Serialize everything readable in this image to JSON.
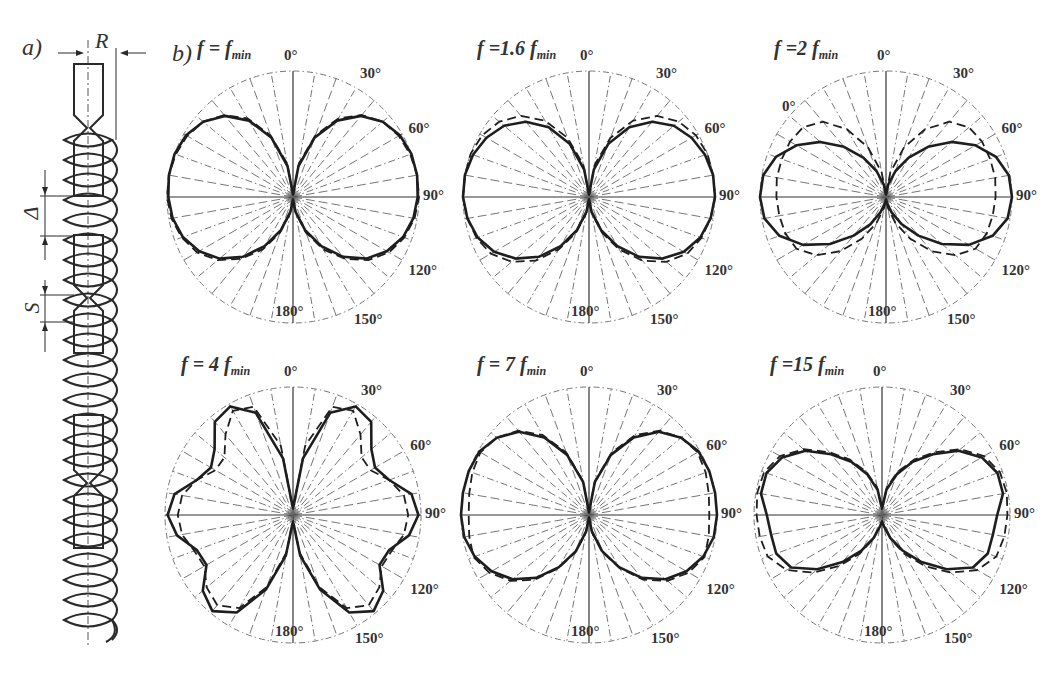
{
  "figure": {
    "panel_a_label": "a)",
    "panel_b_label": "b)",
    "helix_dimensions": {
      "radius": "R",
      "gap": "Δ",
      "pitch": "S"
    }
  },
  "chart_data": [
    {
      "type": "polar",
      "title": "f = f_min",
      "title_main": "f = f",
      "title_sub": "min",
      "center": [
        293,
        197
      ],
      "radius": 126,
      "angle_labels": [
        "0°",
        "30°",
        "60°",
        "90°",
        "120°",
        "150°",
        "180°"
      ],
      "series": [
        {
          "name": "measured",
          "style": "solid",
          "theta": [
            0,
            10,
            20,
            30,
            40,
            50,
            60,
            70,
            80,
            90,
            100,
            110,
            120,
            130,
            140,
            150,
            160,
            170,
            180
          ],
          "r": [
            0.02,
            0.25,
            0.5,
            0.7,
            0.84,
            0.93,
            0.98,
            1.0,
            1.0,
            0.99,
            0.97,
            0.93,
            0.86,
            0.76,
            0.62,
            0.45,
            0.28,
            0.12,
            0.02
          ]
        },
        {
          "name": "computed",
          "style": "dashed",
          "theta": [
            0,
            10,
            20,
            30,
            40,
            50,
            60,
            70,
            80,
            90,
            100,
            110,
            120,
            130,
            140,
            150,
            160,
            170,
            180
          ],
          "r": [
            0.02,
            0.27,
            0.52,
            0.72,
            0.85,
            0.93,
            0.97,
            0.99,
            1.0,
            1.0,
            0.98,
            0.94,
            0.88,
            0.78,
            0.64,
            0.48,
            0.3,
            0.13,
            0.02
          ]
        }
      ]
    },
    {
      "type": "polar",
      "title": "f = 1.6 f_min",
      "title_main": "f =1.6 f",
      "title_sub": "min",
      "center": [
        589,
        197
      ],
      "radius": 126,
      "angle_labels": [
        "0°",
        "30°",
        "60°",
        "90°",
        "120°",
        "150°",
        "180°"
      ],
      "series": [
        {
          "name": "measured",
          "style": "solid",
          "theta": [
            0,
            10,
            20,
            30,
            40,
            50,
            60,
            70,
            80,
            90,
            100,
            110,
            120,
            130,
            140,
            150,
            160,
            170,
            180
          ],
          "r": [
            0.02,
            0.22,
            0.45,
            0.64,
            0.78,
            0.88,
            0.94,
            0.98,
            1.0,
            1.0,
            0.98,
            0.94,
            0.87,
            0.76,
            0.62,
            0.45,
            0.28,
            0.12,
            0.02
          ]
        },
        {
          "name": "computed",
          "style": "dashed",
          "theta": [
            0,
            10,
            20,
            30,
            40,
            50,
            60,
            70,
            80,
            90,
            100,
            110,
            120,
            130,
            140,
            150,
            160,
            170,
            180
          ],
          "r": [
            0.02,
            0.26,
            0.5,
            0.7,
            0.84,
            0.93,
            0.98,
            1.0,
            1.0,
            1.0,
            0.98,
            0.95,
            0.9,
            0.8,
            0.66,
            0.48,
            0.3,
            0.13,
            0.02
          ]
        }
      ]
    },
    {
      "type": "polar",
      "title": "f = 2 f_min",
      "title_main": "f =2 f",
      "title_sub": "min",
      "center": [
        886,
        197
      ],
      "radius": 126,
      "angle_labels": [
        "0°",
        "30°",
        "60°",
        "90°",
        "120°",
        "150°",
        "180°"
      ],
      "extra_labels": [
        {
          "text": "0°",
          "x": 782,
          "y": 98
        }
      ],
      "series": [
        {
          "name": "measured",
          "style": "solid",
          "theta": [
            0,
            10,
            20,
            30,
            40,
            50,
            60,
            70,
            80,
            90,
            100,
            110,
            120,
            130,
            140,
            150,
            160,
            170,
            180
          ],
          "r": [
            0.02,
            0.1,
            0.22,
            0.36,
            0.52,
            0.68,
            0.82,
            0.93,
            0.99,
            1.0,
            0.98,
            0.9,
            0.76,
            0.58,
            0.4,
            0.25,
            0.13,
            0.05,
            0.02
          ]
        },
        {
          "name": "computed",
          "style": "dashed",
          "theta": [
            0,
            10,
            20,
            30,
            40,
            50,
            60,
            70,
            80,
            90,
            100,
            110,
            120,
            130,
            140,
            150,
            160,
            170,
            180
          ],
          "r": [
            0.02,
            0.2,
            0.42,
            0.62,
            0.78,
            0.86,
            0.88,
            0.88,
            0.88,
            0.87,
            0.86,
            0.85,
            0.82,
            0.72,
            0.56,
            0.38,
            0.22,
            0.09,
            0.02
          ]
        }
      ]
    },
    {
      "type": "polar",
      "title": "f = 4 f_min",
      "title_main": "f = 4 f",
      "title_sub": "min",
      "center": [
        293,
        515
      ],
      "radius": 128,
      "angle_labels": [
        "0°",
        "30°",
        "60°",
        "90°",
        "120°",
        "150°",
        "180°"
      ],
      "series": [
        {
          "name": "measured",
          "style": "solid",
          "theta": [
            0,
            10,
            20,
            30,
            40,
            50,
            60,
            70,
            80,
            90,
            100,
            110,
            120,
            130,
            140,
            150,
            160,
            170,
            180
          ],
          "r": [
            0.05,
            0.45,
            0.85,
            0.98,
            0.95,
            0.8,
            0.74,
            0.8,
            0.94,
            0.98,
            0.92,
            0.8,
            0.78,
            0.92,
            0.98,
            0.88,
            0.62,
            0.32,
            0.05
          ]
        },
        {
          "name": "computed",
          "style": "dashed",
          "theta": [
            0,
            10,
            20,
            30,
            40,
            50,
            60,
            70,
            80,
            90,
            100,
            110,
            120,
            130,
            140,
            150,
            160,
            170,
            180
          ],
          "r": [
            0.05,
            0.55,
            0.9,
            0.94,
            0.82,
            0.7,
            0.7,
            0.8,
            0.88,
            0.9,
            0.88,
            0.82,
            0.8,
            0.88,
            0.92,
            0.84,
            0.6,
            0.3,
            0.05
          ]
        }
      ]
    },
    {
      "type": "polar",
      "title": "f = 7 f_min",
      "title_main": "f = 7 f",
      "title_sub": "min",
      "center": [
        589,
        515
      ],
      "radius": 128,
      "angle_labels": [
        "0°",
        "30°",
        "60°",
        "90°",
        "120°",
        "150°",
        "180°"
      ],
      "series": [
        {
          "name": "measured",
          "style": "solid",
          "theta": [
            0,
            10,
            20,
            30,
            40,
            50,
            60,
            70,
            80,
            90,
            100,
            110,
            120,
            130,
            140,
            150,
            160,
            170,
            180
          ],
          "r": [
            0.02,
            0.26,
            0.5,
            0.7,
            0.85,
            0.94,
            0.99,
            1.0,
            1.0,
            1.0,
            0.99,
            0.95,
            0.88,
            0.78,
            0.64,
            0.47,
            0.3,
            0.13,
            0.02
          ]
        },
        {
          "name": "computed",
          "style": "dashed",
          "theta": [
            0,
            10,
            20,
            30,
            40,
            50,
            60,
            70,
            80,
            90,
            100,
            110,
            120,
            130,
            140,
            150,
            160,
            170,
            180
          ],
          "r": [
            0.02,
            0.27,
            0.52,
            0.72,
            0.86,
            0.94,
            0.98,
            0.97,
            0.95,
            0.94,
            0.95,
            0.96,
            0.9,
            0.8,
            0.66,
            0.48,
            0.31,
            0.14,
            0.02
          ]
        }
      ]
    },
    {
      "type": "polar",
      "title": "f = 15 f_min",
      "title_main": "f =15 f",
      "title_sub": "min",
      "center": [
        882,
        515
      ],
      "radius": 128,
      "angle_labels": [
        "0°",
        "30°",
        "60°",
        "90°",
        "120°",
        "150°",
        "180°"
      ],
      "series": [
        {
          "name": "measured",
          "style": "solid",
          "theta": [
            0,
            10,
            20,
            30,
            40,
            50,
            60,
            70,
            80,
            90,
            100,
            110,
            120,
            130,
            140,
            150,
            160,
            170,
            180
          ],
          "r": [
            0.05,
            0.2,
            0.34,
            0.48,
            0.62,
            0.78,
            0.9,
            0.96,
            0.96,
            0.9,
            0.88,
            0.88,
            0.82,
            0.66,
            0.48,
            0.32,
            0.19,
            0.09,
            0.05
          ]
        },
        {
          "name": "computed",
          "style": "dashed",
          "theta": [
            0,
            10,
            20,
            30,
            40,
            50,
            60,
            70,
            80,
            90,
            100,
            110,
            120,
            130,
            140,
            150,
            160,
            170,
            180
          ],
          "r": [
            0.05,
            0.22,
            0.36,
            0.5,
            0.64,
            0.8,
            0.92,
            0.98,
            0.99,
            0.98,
            0.97,
            0.95,
            0.86,
            0.7,
            0.52,
            0.35,
            0.2,
            0.09,
            0.05
          ]
        }
      ]
    }
  ]
}
